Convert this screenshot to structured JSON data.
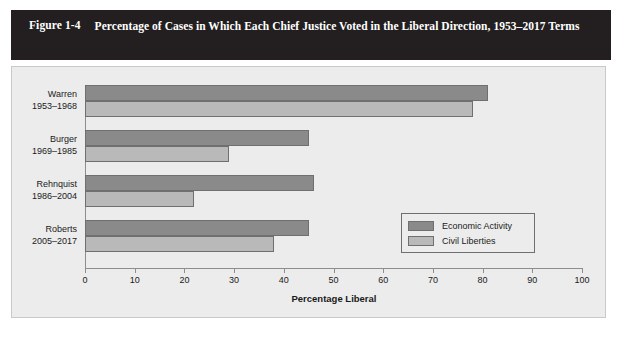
{
  "figure": {
    "number": "Figure 1-4",
    "title": "Percentage of Cases in Which Each Chief Justice Voted in the Liberal Direction, 1953–2017 Terms"
  },
  "chart_data": {
    "type": "bar",
    "orientation": "horizontal",
    "title": "Percentage of Cases in Which Each Chief Justice Voted in the Liberal Direction, 1953–2017 Terms",
    "xlabel": "Percentage Liberal",
    "ylabel": "",
    "xlim": [
      0,
      100
    ],
    "xticks": [
      "0",
      "10",
      "20",
      "30",
      "40",
      "50",
      "60",
      "70",
      "80",
      "90",
      "100"
    ],
    "grid": false,
    "legend_position": "inside-right",
    "categories": [
      {
        "name": "Warren",
        "years": "1953–1968"
      },
      {
        "name": "Burger",
        "years": "1969–1985"
      },
      {
        "name": "Rehnquist",
        "years": "1986–2004"
      },
      {
        "name": "Roberts",
        "years": "2005–2017"
      }
    ],
    "series": [
      {
        "name": "Economic Activity",
        "color": "#8a8a8a",
        "values": [
          81,
          45,
          46,
          45
        ]
      },
      {
        "name": "Civil Liberties",
        "color": "#b9b9b9",
        "values": [
          78,
          29,
          22,
          38
        ]
      }
    ]
  },
  "legend": {
    "items": [
      {
        "label": "Economic Activity"
      },
      {
        "label": "Civil Liberties"
      }
    ]
  },
  "colors": {
    "banner": "#231f20",
    "panel": "#ececec",
    "economic": "#8a8a8a",
    "civil": "#b9b9b9",
    "axis": "#8d8d8d"
  }
}
